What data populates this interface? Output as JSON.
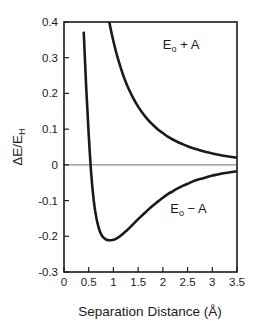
{
  "chart_data": {
    "type": "line",
    "title": "",
    "xlabel": "Separation Distance (Å)",
    "ylabel": "ΔE/E",
    "ylabel_sub": "H",
    "xlim": [
      0,
      3.5
    ],
    "ylim": [
      -0.3,
      0.4
    ],
    "grid": false,
    "legend_position": "inline-annotation",
    "xticks": [
      0,
      0.5,
      1,
      1.5,
      2,
      2.5,
      3,
      3.5
    ],
    "xtick_labels": [
      "0",
      "0.5",
      "1",
      "1.5",
      "2",
      "2.5",
      "3",
      "3.5"
    ],
    "yticks": [
      0.4,
      0.3,
      0.2,
      0.1,
      0,
      -0.1,
      -0.2,
      -0.3
    ],
    "ytick_labels": [
      "0.4",
      "0.3",
      "0.2",
      "0.1",
      "0",
      "-0.1",
      "-0.2",
      "-0.3"
    ],
    "zero_line": 0,
    "series": [
      {
        "name": "Eₒ + A",
        "label_text": "E",
        "label_sub": "o",
        "label_tail": " + A",
        "color": "#1a1a1a",
        "x": [
          0.4,
          0.45,
          0.5,
          0.55,
          0.6,
          0.65,
          0.7,
          0.75,
          0.8,
          0.85,
          0.9,
          0.95,
          1.0,
          1.05,
          1.1,
          1.15,
          1.2,
          1.25,
          1.3,
          1.4,
          1.5,
          1.6,
          1.7,
          1.8,
          1.9,
          2.0,
          2.1,
          2.2,
          2.3,
          2.4,
          2.5,
          2.6,
          2.7,
          2.8,
          2.9,
          3.0,
          3.1,
          3.2,
          3.3,
          3.4,
          3.5
        ],
        "y": [
          1.24,
          1.085,
          0.955,
          0.846,
          0.754,
          0.675,
          0.607,
          0.548,
          0.497,
          0.452,
          0.412,
          0.377,
          0.346,
          0.318,
          0.293,
          0.271,
          0.25,
          0.232,
          0.215,
          0.187,
          0.163,
          0.143,
          0.126,
          0.112,
          0.099,
          0.089,
          0.079,
          0.071,
          0.064,
          0.058,
          0.052,
          0.047,
          0.043,
          0.039,
          0.035,
          0.032,
          0.029,
          0.026,
          0.024,
          0.022,
          0.02
        ]
      },
      {
        "name": "Eₒ − A",
        "label_text": "E",
        "label_sub": "o",
        "label_tail": " − A",
        "color": "#1a1a1a",
        "x": [
          0.4,
          0.45,
          0.5,
          0.55,
          0.6,
          0.65,
          0.7,
          0.75,
          0.8,
          0.85,
          0.9,
          0.95,
          1.0,
          1.05,
          1.1,
          1.15,
          1.2,
          1.25,
          1.3,
          1.4,
          1.5,
          1.6,
          1.7,
          1.8,
          1.9,
          2.0,
          2.1,
          2.2,
          2.3,
          2.4,
          2.5,
          2.6,
          2.7,
          2.8,
          2.9,
          3.0,
          3.1,
          3.2,
          3.3,
          3.4,
          3.5
        ],
        "y": [
          0.37,
          0.215,
          0.085,
          -0.024,
          -0.098,
          -0.145,
          -0.175,
          -0.194,
          -0.204,
          -0.209,
          -0.211,
          -0.211,
          -0.21,
          -0.207,
          -0.203,
          -0.198,
          -0.192,
          -0.186,
          -0.18,
          -0.166,
          -0.152,
          -0.139,
          -0.126,
          -0.114,
          -0.103,
          -0.092,
          -0.082,
          -0.074,
          -0.066,
          -0.059,
          -0.053,
          -0.047,
          -0.042,
          -0.038,
          -0.034,
          -0.03,
          -0.027,
          -0.024,
          -0.022,
          -0.02,
          -0.018
        ]
      }
    ],
    "annotations": [
      {
        "text": "Eₒ + A",
        "x": 2.0,
        "y": 0.325
      },
      {
        "text": "Eₒ − A",
        "x": 2.15,
        "y": -0.135
      }
    ],
    "minimum_point": {
      "x": 1.05,
      "y": -0.211,
      "series": "Eₒ − A"
    },
    "zero_crossing": {
      "x": 0.54,
      "series": "Eₒ − A"
    }
  },
  "axes": {
    "x_title": "Separation Distance (Å)",
    "y_title_main": "ΔE/E",
    "y_title_sub": "H"
  },
  "style": {
    "frame_color": "#1a1a1a",
    "curve_color": "#1a1a1a",
    "zero_line_color": "#8c8c8c",
    "background": "#ffffff"
  }
}
